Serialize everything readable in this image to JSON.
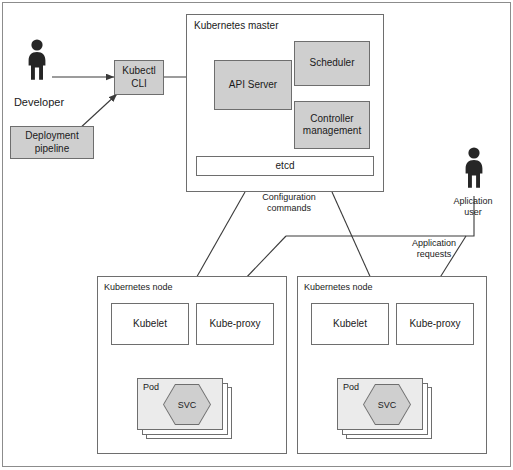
{
  "diagram": {
    "colors": {
      "box_fill_gray": "#cfcfcf",
      "box_fill_white": "#ffffff",
      "pod_fill": "#ebebeb",
      "stroke": "#6e6e6e",
      "text": "#1a1a1a",
      "figure": "#262626"
    }
  },
  "actors": {
    "developer": {
      "label": "Developer",
      "icon": "person-icon"
    },
    "application_user": {
      "label": "Aplication\nuser",
      "icon": "person-icon"
    }
  },
  "left_column": {
    "kubectl": {
      "label": "Kubectl\nCLI"
    },
    "deployment_pipeline": {
      "label": "Deployment\npipeline"
    }
  },
  "master": {
    "title": "Kubernetes master",
    "components": {
      "api_server": {
        "label": "API Server"
      },
      "scheduler": {
        "label": "Scheduler"
      },
      "controller_management": {
        "label": "Controller\nmanagement"
      },
      "etcd": {
        "label": "etcd"
      }
    }
  },
  "nodes": [
    {
      "title": "Kubernetes node",
      "kubelet": {
        "label": "Kubelet"
      },
      "kube_proxy": {
        "label": "Kube-proxy"
      },
      "pod": {
        "label": "Pod",
        "service": {
          "label": "SVC"
        }
      }
    },
    {
      "title": "Kubernetes node",
      "kubelet": {
        "label": "Kubelet"
      },
      "kube_proxy": {
        "label": "Kube-proxy"
      },
      "pod": {
        "label": "Pod",
        "service": {
          "label": "SVC"
        }
      }
    }
  ],
  "edge_labels": {
    "configuration_commands": "Configuration\ncommands",
    "application_requests": "Application\nrequests"
  }
}
